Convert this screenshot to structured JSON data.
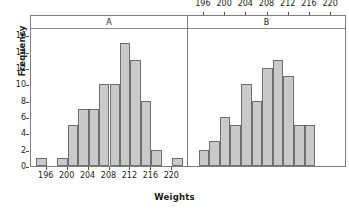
{
  "chart_data": {
    "type": "bar",
    "title": "",
    "subtitle": "",
    "xlabel": "Weights",
    "ylabel": "Frequency",
    "ylim": [
      0,
      17
    ],
    "xlim": [
      193,
      223
    ],
    "grid": false,
    "legend_position": "none",
    "bin_width": 2,
    "y_ticks": [
      0,
      2,
      4,
      6,
      8,
      10,
      12,
      14,
      16
    ],
    "x_ticks": [
      196,
      200,
      204,
      208,
      212,
      216,
      220
    ],
    "panels": [
      {
        "label": "A",
        "axis_position": "bottom",
        "bin_starts": [
          194,
          198,
          200,
          202,
          204,
          206,
          208,
          210,
          212,
          214,
          216,
          220
        ],
        "bin_labels": [
          "194-196",
          "198-200",
          "200-202",
          "202-204",
          "204-206",
          "206-208",
          "208-210",
          "210-212",
          "212-214",
          "214-216",
          "216-218",
          "220-222"
        ],
        "values": [
          1,
          1,
          5,
          7,
          7,
          10,
          10,
          15,
          13,
          8,
          2,
          1
        ]
      },
      {
        "label": "B",
        "axis_position": "top",
        "bin_starts": [
          195,
          197,
          199,
          201,
          203,
          205,
          207,
          209,
          211,
          213,
          215
        ],
        "bin_labels": [
          "195-197",
          "197-199",
          "199-201",
          "201-203",
          "203-205",
          "205-207",
          "207-209",
          "209-211",
          "211-213",
          "213-215",
          "215-217"
        ],
        "values": [
          2,
          3,
          6,
          5,
          10,
          8,
          12,
          13,
          11,
          5,
          5
        ]
      }
    ]
  },
  "axes": {
    "y_title": "Frequency",
    "x_title": "Weights",
    "y_tick_labels": [
      "0",
      "2",
      "4",
      "6",
      "8",
      "10",
      "12",
      "14",
      "16"
    ],
    "x_tick_labels": [
      "196",
      "200",
      "204",
      "208",
      "212",
      "216",
      "220"
    ]
  },
  "panel_titles": {
    "a": "A",
    "b": "B"
  },
  "colors": {
    "bar_fill": "#c9c9c9",
    "bar_border": "#6f6f6f",
    "axis": "#4a4a4a",
    "frame": "#7d7d7d",
    "text": "#1a1a1a",
    "background": "#ffffff"
  }
}
